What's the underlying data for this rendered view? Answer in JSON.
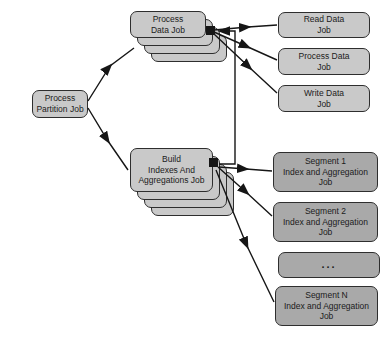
{
  "diagram": {
    "colors": {
      "box_light": "#c9c9c9",
      "box_dark": "#a9a9a9",
      "border": "#2e2e2e",
      "line": "#161616",
      "background": "#ffffff"
    },
    "nodes": {
      "partition": {
        "label": "Process\nPartition Job"
      },
      "process_data_stack": {
        "label": "Process\nData Job",
        "stack_count": 4
      },
      "build_stack": {
        "label": "Build\nIndexes And\nAggregations Job",
        "stack_count": 4
      },
      "read_data": {
        "label": "Read Data\nJob"
      },
      "process_data": {
        "label": "Process Data\nJob"
      },
      "write_data": {
        "label": "Write Data\nJob"
      },
      "segment_1": {
        "label": "Segment 1\nIndex and Aggregation\nJob"
      },
      "segment_2": {
        "label": "Segment 2\nIndex and Aggregation\nJob"
      },
      "ellipsis": {
        "label": "..."
      },
      "segment_n": {
        "label": "Segment N\nIndex and Aggregation\nJob"
      }
    }
  }
}
